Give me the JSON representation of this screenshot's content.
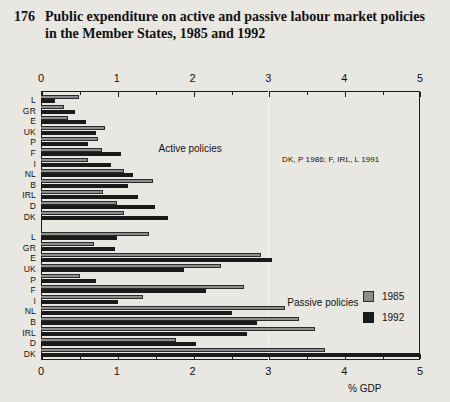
{
  "figure": {
    "number": "176",
    "title": "Public expenditure on active and passive labour market policies in the Member States, 1985 and 1992",
    "note": "DK, P 1986; F, IRL, L 1991",
    "unit_label": "% GDP"
  },
  "legend": {
    "items": [
      {
        "label": "1985",
        "color": "#8d8d8d"
      },
      {
        "label": "1992",
        "color": "#1a1a1a"
      }
    ]
  },
  "sections": {
    "active_label": "Active policies",
    "passive_label": "Passive policies"
  },
  "chart_data": {
    "type": "bar",
    "orientation": "horizontal",
    "title": "Public expenditure on active and passive labour market policies in the Member States, 1985 and 1992",
    "xlabel": "% GDP",
    "ylabel": "",
    "xlim": [
      0,
      5
    ],
    "xticks": [
      0,
      1,
      2,
      3,
      4,
      5
    ],
    "xtick_labels": [
      "0",
      "1",
      "2",
      "3",
      "4",
      "5"
    ],
    "minor_xticks": [
      0.5,
      1.5,
      2.5,
      3.5,
      4.5
    ],
    "grid": false,
    "legend_position": "right",
    "annotations": [
      "Active policies",
      "Passive policies",
      "DK, P 1986; F, IRL, L 1991"
    ],
    "panels": [
      {
        "name": "Active policies",
        "categories": [
          "L",
          "GR",
          "E",
          "UK",
          "P",
          "F",
          "I",
          "NL",
          "B",
          "IRL",
          "D",
          "DK"
        ],
        "series": [
          {
            "name": "1985",
            "color": "#8d8d8d",
            "values": [
              0.5,
              0.3,
              0.35,
              0.85,
              0.75,
              0.8,
              0.62,
              1.1,
              1.48,
              0.82,
              1.0,
              1.1
            ]
          },
          {
            "name": "1992",
            "color": "#1a1a1a",
            "values": [
              0.18,
              0.45,
              0.6,
              0.72,
              0.62,
              1.05,
              0.92,
              1.22,
              1.15,
              1.28,
              1.5,
              1.68
            ]
          }
        ]
      },
      {
        "name": "Passive policies",
        "categories": [
          "L",
          "GR",
          "E",
          "UK",
          "P",
          "F",
          "I",
          "NL",
          "B",
          "IRL",
          "D",
          "DK"
        ],
        "series": [
          {
            "name": "1985",
            "color": "#8d8d8d",
            "values": [
              1.42,
              0.7,
              2.9,
              2.38,
              0.52,
              2.68,
              1.35,
              3.22,
              3.4,
              3.62,
              1.78,
              3.75
            ]
          },
          {
            "name": "1992",
            "color": "#1a1a1a",
            "values": [
              1.0,
              0.98,
              3.05,
              1.88,
              0.72,
              2.18,
              1.02,
              2.52,
              2.85,
              2.72,
              2.05,
              5.0
            ]
          }
        ]
      }
    ]
  }
}
